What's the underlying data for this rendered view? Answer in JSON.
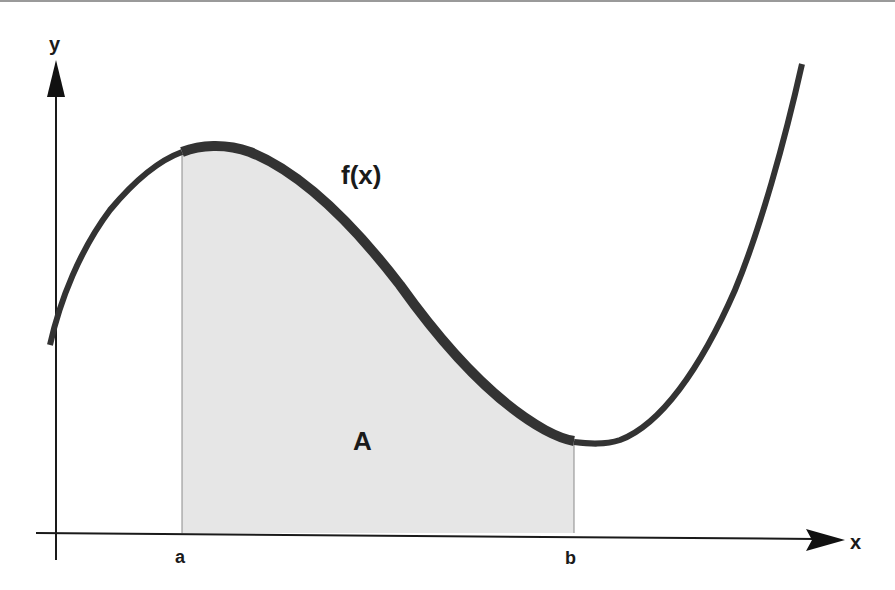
{
  "diagram": {
    "axes": {
      "x_label": "x",
      "y_label": "y"
    },
    "function_label": "f(x)",
    "area_label": "A",
    "bounds": {
      "lower_label": "a",
      "upper_label": "b"
    },
    "colors": {
      "curve": "#333333",
      "area_fill": "#e6e6e6",
      "axes": "#1a1a1a",
      "text": "#1a1a1a"
    }
  }
}
